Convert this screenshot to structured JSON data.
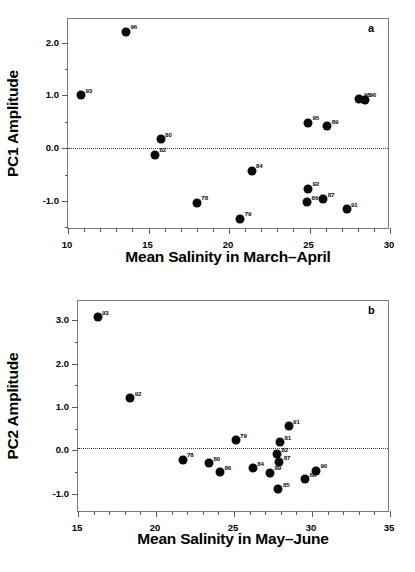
{
  "figure": {
    "panels": [
      {
        "letter": "a",
        "xlabel": "Mean Salinity in March–April",
        "ylabel": "PC1 Amplitude"
      },
      {
        "letter": "b",
        "xlabel": "Mean Salinity in May–June",
        "ylabel": "PC2 Amplitude"
      }
    ]
  },
  "chart_data": [
    {
      "type": "scatter",
      "panel": "a",
      "title": "",
      "xlabel": "Mean Salinity in March–April",
      "ylabel": "PC1 Amplitude",
      "xlim": [
        10,
        30
      ],
      "ylim": [
        -1.55,
        2.45
      ],
      "xticks": [
        10,
        15,
        20,
        25,
        30
      ],
      "xticklabels": [
        "10",
        "15",
        "20",
        "25",
        "30"
      ],
      "xminorticks": [
        11,
        12,
        13,
        14,
        16,
        17,
        18,
        19,
        21,
        22,
        23,
        24,
        26,
        27,
        28,
        29
      ],
      "yticks": [
        -1.0,
        0.0,
        1.0,
        2.0
      ],
      "yticklabels": [
        "-1.0",
        "0.0",
        "1.0",
        "2.0"
      ],
      "yminorticks": [
        -1.5,
        -0.5,
        0.5,
        1.5
      ],
      "grid": false,
      "legend": false,
      "reference_line": {
        "axis": "y",
        "value": 0.0,
        "style": "dotted"
      },
      "points": [
        {
          "label": "93",
          "x": 10.8,
          "y": 1.0
        },
        {
          "label": "96",
          "x": 13.6,
          "y": 2.21
        },
        {
          "label": "80",
          "x": 15.75,
          "y": 0.17
        },
        {
          "label": "82",
          "x": 15.4,
          "y": -0.12
        },
        {
          "label": "78",
          "x": 18.0,
          "y": -1.03
        },
        {
          "label": "79",
          "x": 20.7,
          "y": -1.34
        },
        {
          "label": "84",
          "x": 21.4,
          "y": -0.43
        },
        {
          "label": "95",
          "x": 24.9,
          "y": 0.48
        },
        {
          "label": "89",
          "x": 26.1,
          "y": 0.42
        },
        {
          "label": "92",
          "x": 24.9,
          "y": -0.77
        },
        {
          "label": "86",
          "x": 24.85,
          "y": -1.02
        },
        {
          "label": "87",
          "x": 25.85,
          "y": -0.97
        },
        {
          "label": "91",
          "x": 27.3,
          "y": -1.16
        },
        {
          "label": "98",
          "x": 28.1,
          "y": 0.93
        },
        {
          "label": "96b",
          "x": 28.45,
          "y": 0.92
        }
      ]
    },
    {
      "type": "scatter",
      "panel": "b",
      "title": "",
      "xlabel": "Mean Salinity in May–June",
      "ylabel": "PC2 Amplitude",
      "xlim": [
        15,
        35
      ],
      "ylim": [
        -1.45,
        3.45
      ],
      "xticks": [
        15,
        20,
        25,
        30,
        35
      ],
      "xticklabels": [
        "15",
        "20",
        "25",
        "30",
        "35"
      ],
      "xminorticks": [
        16,
        17,
        18,
        19,
        21,
        22,
        23,
        24,
        26,
        27,
        28,
        29,
        31,
        32,
        33,
        34
      ],
      "yticks": [
        -1.0,
        0.0,
        1.0,
        2.0,
        3.0
      ],
      "yticklabels": [
        "-1.0",
        "0.0",
        "1.0",
        "2.0",
        "3.0"
      ],
      "yminorticks": [
        -0.5,
        0.5,
        1.5,
        2.5,
        3.5
      ],
      "grid": false,
      "legend": false,
      "reference_line": {
        "axis": "y",
        "value": 0.05,
        "style": "dotted"
      },
      "points": [
        {
          "label": "93",
          "x": 16.25,
          "y": 3.08
        },
        {
          "label": "92",
          "x": 18.35,
          "y": 1.2
        },
        {
          "label": "78",
          "x": 21.7,
          "y": -0.22
        },
        {
          "label": "80",
          "x": 23.4,
          "y": -0.3
        },
        {
          "label": "86",
          "x": 24.1,
          "y": -0.51
        },
        {
          "label": "79",
          "x": 25.1,
          "y": 0.23
        },
        {
          "label": "84",
          "x": 26.2,
          "y": -0.42
        },
        {
          "label": "81",
          "x": 27.95,
          "y": 0.18
        },
        {
          "label": "82",
          "x": 27.75,
          "y": -0.09
        },
        {
          "label": "87",
          "x": 27.9,
          "y": -0.28
        },
        {
          "label": "89",
          "x": 27.3,
          "y": -0.52
        },
        {
          "label": "85",
          "x": 27.85,
          "y": -0.9
        },
        {
          "label": "91",
          "x": 28.5,
          "y": 0.55
        },
        {
          "label": "88",
          "x": 29.55,
          "y": -0.67
        },
        {
          "label": "90",
          "x": 30.25,
          "y": -0.47
        }
      ]
    }
  ]
}
